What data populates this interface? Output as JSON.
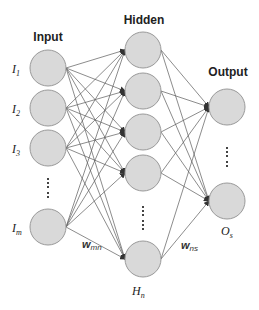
{
  "diagram": {
    "type": "neural-network",
    "layers": {
      "input": {
        "title": "Input",
        "nodes": [
          {
            "label": "I",
            "sub": "1"
          },
          {
            "label": "I",
            "sub": "2"
          },
          {
            "label": "I",
            "sub": "3"
          },
          {
            "label": "I",
            "sub": "m"
          }
        ],
        "ellipsis": "⋮"
      },
      "hidden": {
        "title": "Hidden",
        "nodes": [
          {
            "label": "",
            "sub": ""
          },
          {
            "label": "",
            "sub": ""
          },
          {
            "label": "",
            "sub": ""
          },
          {
            "label": "",
            "sub": ""
          },
          {
            "label": "H",
            "sub": "n"
          }
        ],
        "ellipsis": "⋮"
      },
      "output": {
        "title": "Output",
        "nodes": [
          {
            "label": "",
            "sub": ""
          },
          {
            "label": "O",
            "sub": "s"
          }
        ],
        "ellipsis": "⋮"
      }
    },
    "weights": {
      "input_hidden": {
        "label": "w",
        "sub": "mn"
      },
      "hidden_output": {
        "label": "w",
        "sub": "ns"
      }
    },
    "colors": {
      "node_fill": "#d9d9d9",
      "node_stroke": "#9a9a9a",
      "edge": "#5a5a5a"
    }
  }
}
